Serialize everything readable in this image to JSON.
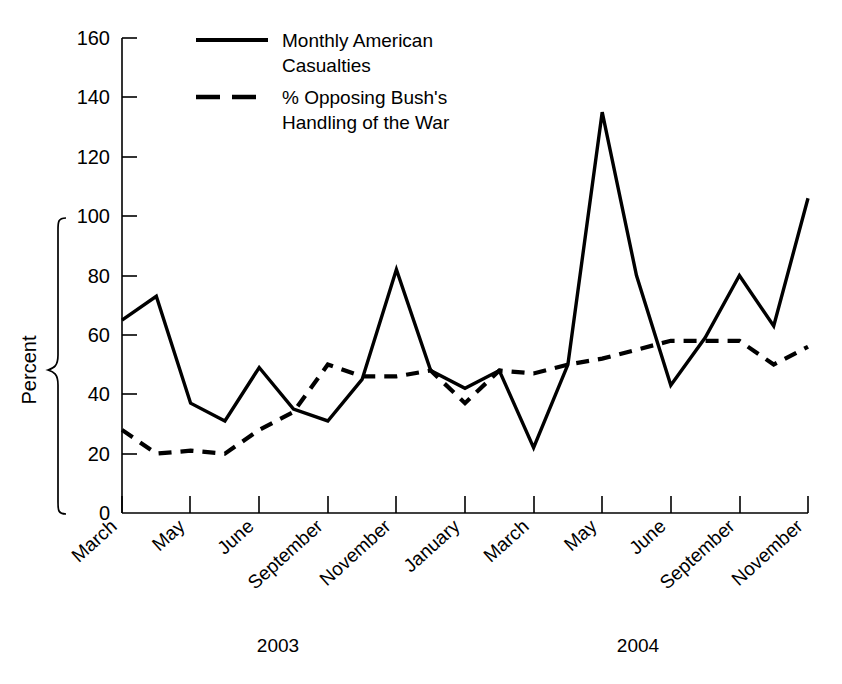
{
  "chart_data": {
    "type": "line",
    "title": "",
    "xlabel": "",
    "ylabel": "Percent",
    "ylim": [
      0,
      160
    ],
    "yticks": [
      0,
      20,
      40,
      60,
      80,
      100,
      120,
      140,
      160
    ],
    "grid": false,
    "legend_position": "top-center",
    "x": [
      "March 2003",
      "April 2003",
      "May 2003",
      "June 2003",
      "July 2003",
      "August 2003",
      "September 2003",
      "October 2003",
      "November 2003",
      "December 2003",
      "January 2004",
      "February 2004",
      "March 2004",
      "April 2004",
      "May 2004",
      "June 2004",
      "July 2004",
      "August 2004",
      "September 2004",
      "October 2004",
      "November 2004"
    ],
    "xtick_labels": [
      "March",
      "May",
      "June",
      "September",
      "November",
      "January",
      "March",
      "May",
      "June",
      "September",
      "November"
    ],
    "period_labels": [
      "2003",
      "2004"
    ],
    "series": [
      {
        "name": "Monthly American Casualties",
        "style": "solid",
        "values": [
          65,
          73,
          37,
          31,
          49,
          35,
          31,
          45,
          82,
          48,
          42,
          48,
          22,
          50,
          135,
          80,
          43,
          59,
          80,
          63,
          106
        ]
      },
      {
        "name": "% Opposing Bush's Handling of the War",
        "style": "dashed",
        "values": [
          28,
          20,
          21,
          20,
          28,
          34,
          50,
          46,
          46,
          48,
          37,
          48,
          47,
          50,
          52,
          55,
          58,
          58,
          58,
          50,
          56
        ]
      }
    ],
    "legend": [
      {
        "label_line1": "Monthly American",
        "label_line2": "Casualties",
        "style": "solid"
      },
      {
        "label_line1": "% Opposing Bush's",
        "label_line2": "Handling of the War",
        "style": "dashed"
      }
    ],
    "ylabel_brace_range": [
      0,
      100
    ]
  }
}
